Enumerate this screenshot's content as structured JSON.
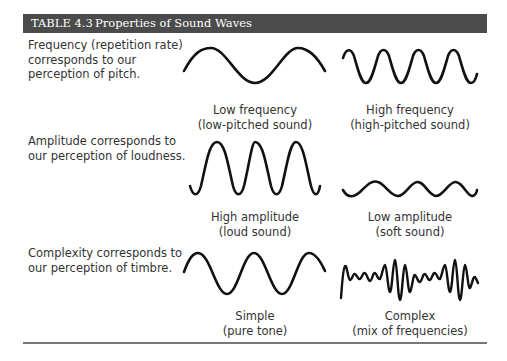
{
  "table": {
    "number": "TABLE 4.3",
    "title": "Properties of Sound Waves",
    "header_color": "#4b4b4b",
    "rows": [
      {
        "description_lines": [
          "Frequency (repetition rate)",
          "corresponds to our",
          "perception of pitch."
        ],
        "left": {
          "label": "Low frequency",
          "sublabel": "(low-pitched sound)"
        },
        "right": {
          "label": "High frequency",
          "sublabel": "(high-pitched sound)"
        }
      },
      {
        "description_lines": [
          "Amplitude corresponds to",
          "our perception of loudness."
        ],
        "left": {
          "label": "High amplitude",
          "sublabel": "(loud sound)"
        },
        "right": {
          "label": "Low amplitude",
          "sublabel": "(soft sound)"
        }
      },
      {
        "description_lines": [
          "Complexity corresponds to",
          "our perception of timbre."
        ],
        "left": {
          "label": "Simple",
          "sublabel": "(pure tone)"
        },
        "right": {
          "label": "Complex",
          "sublabel": "(mix of frequencies)"
        }
      }
    ]
  }
}
